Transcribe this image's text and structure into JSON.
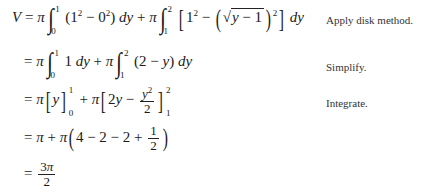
{
  "steps": [
    {
      "id": "step1",
      "lhs": "V",
      "expression": "V = π ∫₀¹ (1² − 0²) dy + π ∫₁² [1² − (√(y − 1))²] dy",
      "note": "Apply disk method."
    },
    {
      "id": "step2",
      "expression": "= π ∫₀¹ 1 dy + π ∫₁² (2 − y) dy",
      "note": "Simplify."
    },
    {
      "id": "step3",
      "expression": "= π[y]₀¹ + π[2y − y²/2]₁²",
      "note": "Integrate."
    },
    {
      "id": "step4",
      "expression": "= π + π(4 − 2 − 2 + 1/2)",
      "note": ""
    },
    {
      "id": "step5",
      "expression": "= 3π/2",
      "note": ""
    }
  ],
  "notes": {
    "apply": "Apply disk method.",
    "simplify": "Simplify.",
    "integrate": "Integrate."
  }
}
